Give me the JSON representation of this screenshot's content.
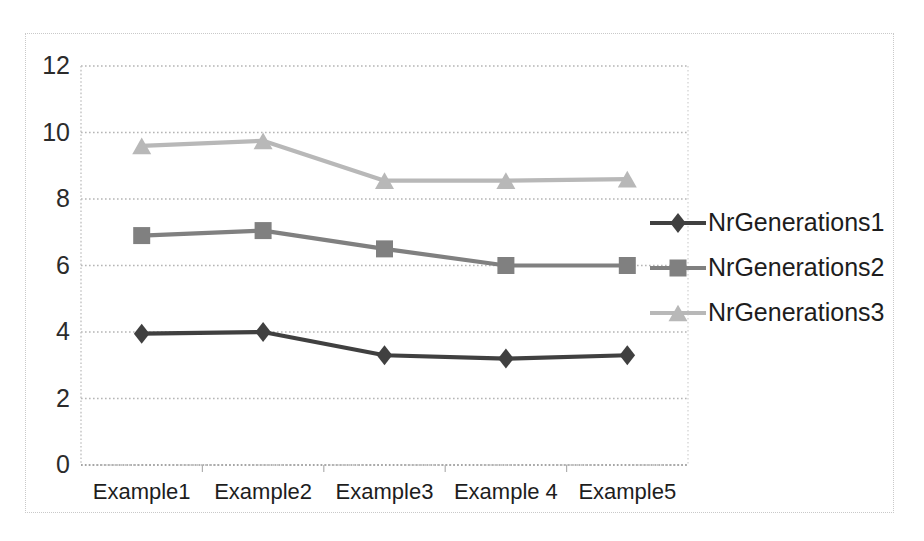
{
  "chart_data": {
    "type": "line",
    "title": "",
    "xlabel": "",
    "ylabel": "",
    "categories": [
      "Example1",
      "Example2",
      "Example3",
      "Example 4",
      "Example5"
    ],
    "ylim": [
      0,
      12
    ],
    "yticks": [
      0,
      2,
      4,
      6,
      8,
      10,
      12
    ],
    "ytick_labels": [
      "0",
      "2",
      "4",
      "6",
      "8",
      "10",
      "12"
    ],
    "grid": true,
    "grid_style": "dotted horizontal",
    "legend_position": "right",
    "series": [
      {
        "name": "NrGenerations1",
        "values": [
          3.95,
          4.0,
          3.3,
          3.2,
          3.3
        ],
        "color": "#404040",
        "marker": "diamond"
      },
      {
        "name": "NrGenerations2",
        "values": [
          6.9,
          7.05,
          6.5,
          6.0,
          6.0
        ],
        "color": "#808080",
        "marker": "square"
      },
      {
        "name": "NrGenerations3",
        "values": [
          9.6,
          9.75,
          8.55,
          8.55,
          8.6
        ],
        "color": "#b8b8b8",
        "marker": "triangle"
      }
    ]
  },
  "axes": {
    "y_axis_line_color": "#d0d0d0",
    "x_axis_line_color": "#a0a0a0",
    "frame_color": "#c9c9c9"
  },
  "legend": {
    "entries": [
      {
        "label": "NrGenerations1"
      },
      {
        "label": "NrGenerations2"
      },
      {
        "label": "NrGenerations3"
      }
    ]
  }
}
